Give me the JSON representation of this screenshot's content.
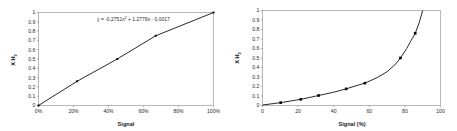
{
  "figure": {
    "background": "#ffffff",
    "panel_count": 2
  },
  "chart_data": [
    {
      "id": "left",
      "type": "scatter",
      "title": "",
      "xlabel": "Signal",
      "ylabel": "X H2",
      "ylabel_main": "X H",
      "ylabel_subscript": "2",
      "xlim": [
        0,
        100
      ],
      "ylim": [
        0,
        1
      ],
      "grid": false,
      "legend": "none",
      "xticks": [
        0,
        20,
        40,
        60,
        80,
        100
      ],
      "xtick_labels": [
        "0%",
        "20%",
        "40%",
        "60%",
        "80%",
        "100%"
      ],
      "yticks": [
        0,
        0.1,
        0.2,
        0.3,
        0.4,
        0.5,
        0.6,
        0.7,
        0.8,
        0.9,
        1
      ],
      "ytick_labels": [
        "0",
        "0.1",
        "0.2",
        "0.3",
        "0.4",
        "0.5",
        "0.6",
        "0.7",
        "0.8",
        "0.9",
        "1"
      ],
      "points": [
        {
          "x": 0,
          "y": 0.0
        },
        {
          "x": 22,
          "y": 0.26
        },
        {
          "x": 45,
          "y": 0.5
        },
        {
          "x": 67,
          "y": 0.75
        },
        {
          "x": 100,
          "y": 1.0
        }
      ],
      "annotation": {
        "text": "y = -0.2751x2 + 1.2779x - 0.0017",
        "part_1": "y = -0.2751x",
        "superscript": "2",
        "part_2": " + 1.2779x - 0.0017",
        "coefficients": {
          "a": -0.2751,
          "b": 1.2779,
          "c": -0.0017
        }
      },
      "marker_color": "#000000",
      "line_color": "#111111"
    },
    {
      "id": "right",
      "type": "scatter",
      "title": "",
      "xlabel": "Signal (%)",
      "ylabel": "X H2",
      "ylabel_main": "X H",
      "ylabel_subscript": "2",
      "xlim": [
        0,
        100
      ],
      "ylim": [
        0,
        1
      ],
      "grid": false,
      "legend": "none",
      "xticks": [
        0,
        20,
        40,
        60,
        80,
        100
      ],
      "xtick_labels": [
        "0",
        "20",
        "40",
        "60",
        "80",
        "100"
      ],
      "yticks": [
        0,
        0.1,
        0.2,
        0.3,
        0.4,
        0.5,
        0.6,
        0.7,
        0.8,
        0.9,
        1
      ],
      "ytick_labels": [
        "0",
        "0.1",
        "0.2",
        "0.3",
        "0.4",
        "0.5",
        "0.6",
        "0.7",
        "0.8",
        "0.9",
        "1"
      ],
      "points": [
        {
          "x": 10.2,
          "y": 0.03
        },
        {
          "x": 21.5,
          "y": 0.065
        },
        {
          "x": 31.5,
          "y": 0.105
        },
        {
          "x": 47.0,
          "y": 0.175
        },
        {
          "x": 57.5,
          "y": 0.235
        },
        {
          "x": 77.5,
          "y": 0.5
        },
        {
          "x": 85.8,
          "y": 0.76
        }
      ],
      "curve": [
        {
          "x": 0,
          "y": 0.005
        },
        {
          "x": 10.2,
          "y": 0.03
        },
        {
          "x": 21.5,
          "y": 0.065
        },
        {
          "x": 31.5,
          "y": 0.105
        },
        {
          "x": 40.0,
          "y": 0.14
        },
        {
          "x": 47.0,
          "y": 0.175
        },
        {
          "x": 52.0,
          "y": 0.205
        },
        {
          "x": 57.5,
          "y": 0.235
        },
        {
          "x": 64.0,
          "y": 0.29
        },
        {
          "x": 70.0,
          "y": 0.355
        },
        {
          "x": 75.0,
          "y": 0.44
        },
        {
          "x": 77.5,
          "y": 0.5
        },
        {
          "x": 81.0,
          "y": 0.6
        },
        {
          "x": 83.5,
          "y": 0.685
        },
        {
          "x": 85.8,
          "y": 0.76
        },
        {
          "x": 88.0,
          "y": 0.87
        },
        {
          "x": 90.0,
          "y": 1.0
        }
      ],
      "marker_color": "#000000",
      "line_color": "#111111"
    }
  ]
}
